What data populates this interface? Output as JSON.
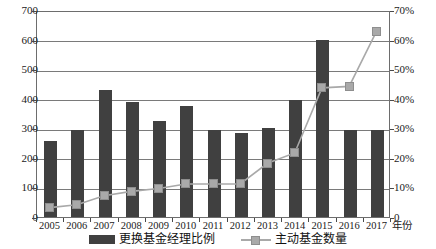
{
  "chart_data": {
    "type": "bar",
    "title": "",
    "xlabel": "年份",
    "ylabel": "",
    "categories": [
      "2005",
      "2006",
      "2007",
      "2008",
      "2009",
      "2010",
      "2011",
      "2012",
      "2013",
      "2014",
      "2015",
      "2016",
      "2017"
    ],
    "grid": true,
    "legend_position": "bottom",
    "axes": {
      "left": {
        "ticks": [
          "0",
          "100",
          "200",
          "300",
          "400",
          "500",
          "600",
          "700"
        ],
        "values": [
          0,
          100,
          200,
          300,
          400,
          500,
          600,
          700
        ],
        "ylim": [
          0,
          700
        ]
      },
      "right": {
        "ticks": [
          "0",
          "10%",
          "20%",
          "30%",
          "40%",
          "50%",
          "60%",
          "70%"
        ],
        "values": [
          0,
          10,
          20,
          30,
          40,
          50,
          60,
          70
        ],
        "ylim": [
          0,
          70
        ]
      }
    },
    "series": [
      {
        "name": "更换基金经理比例",
        "render": "bar",
        "axis": "left",
        "color": "#404040",
        "values": [
          257,
          295,
          428,
          390,
          323,
          376,
          295,
          283,
          302,
          397,
          598,
          295,
          293
        ]
      },
      {
        "name": "主动基金数量",
        "render": "line",
        "axis": "right",
        "color": "#a9a9a9",
        "values": [
          3.5,
          4.5,
          7.5,
          9.0,
          10.0,
          11.5,
          11.5,
          11.5,
          18.5,
          22.0,
          44.0,
          44.5,
          63.0
        ]
      }
    ]
  },
  "legend": {
    "entries": [
      {
        "label": "更换基金经理比例",
        "marker": "bar-swatch"
      },
      {
        "label": "主动基金数量",
        "marker": "line-marker-swatch"
      }
    ]
  }
}
